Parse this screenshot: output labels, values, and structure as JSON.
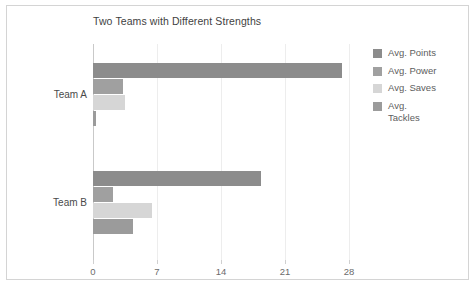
{
  "chart_data": {
    "type": "bar",
    "orientation": "horizontal",
    "title": "Two Teams with Different Strengths",
    "xlabel": "",
    "ylabel": "",
    "categories": [
      "Team A",
      "Team B"
    ],
    "series": [
      {
        "name": "Avg. Points",
        "color": "#8c8c8c",
        "values": [
          27.2,
          18.4
        ]
      },
      {
        "name": "Avg. Power",
        "color": "#a0a0a0",
        "values": [
          3.3,
          2.2
        ]
      },
      {
        "name": "Avg. Saves",
        "color": "#d6d6d6",
        "values": [
          3.5,
          6.5
        ]
      },
      {
        "name": "Avg.\nTackles",
        "color": "#9b9b9b",
        "values": [
          0.3,
          4.4
        ]
      }
    ],
    "xticks": [
      0,
      7,
      14,
      21,
      28
    ],
    "xtick_labels": [
      "0",
      "7",
      "14",
      "21",
      "28"
    ],
    "xlim": [
      0,
      28
    ],
    "grid": "vertical-only",
    "legend_position": "right",
    "background": "#ffffff",
    "frame_color": "#d4d4d4",
    "axis_color": "#c9c9c9",
    "grid_color": "#ededed",
    "text_color": "#4a4a4a"
  }
}
